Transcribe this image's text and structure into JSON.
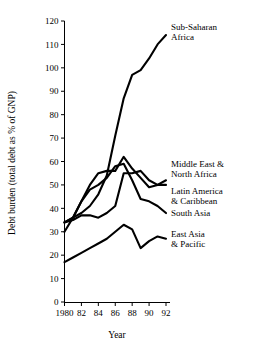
{
  "chart_data": {
    "type": "line",
    "title": "",
    "xlabel": "Year",
    "ylabel": "Debt burden (total debt as % of GNP)",
    "x": [
      1980,
      1981,
      1982,
      1983,
      1984,
      1985,
      1986,
      1987,
      1988,
      1989,
      1990,
      1991,
      1992
    ],
    "xtick_labels": [
      "1980",
      "82",
      "84",
      "86",
      "88",
      "90",
      "92"
    ],
    "xtick_values": [
      1980,
      1982,
      1984,
      1986,
      1988,
      1990,
      1992
    ],
    "ytick_labels": [
      "0",
      "10",
      "20",
      "30",
      "40",
      "50",
      "60",
      "70",
      "80",
      "90",
      "100",
      "110",
      "120"
    ],
    "ytick_values": [
      0,
      10,
      20,
      30,
      40,
      50,
      60,
      70,
      80,
      90,
      100,
      110,
      120
    ],
    "xlim": [
      1980,
      1992
    ],
    "ylim": [
      0,
      120
    ],
    "grid": false,
    "legend": "inline-right-labels",
    "series": [
      {
        "name": "Sub-Saharan Africa",
        "label_lines": [
          "Sub-Saharan",
          "Africa"
        ],
        "values": [
          34,
          38,
          42,
          48,
          53,
          60,
          73,
          88,
          97,
          99,
          104,
          110,
          114
        ]
      },
      {
        "name": "Middle East & North Africa",
        "label_lines": [
          "Middle East &",
          "North Africa"
        ],
        "values": [
          34,
          37,
          47,
          56,
          56,
          58,
          60,
          62,
          55,
          55,
          55,
          51,
          51
        ]
      },
      {
        "name": "Latin America & Caribbean",
        "label_lines": [
          "Latin America",
          "& Caribbean"
        ],
        "values": [
          30,
          36,
          43,
          47,
          49,
          53,
          57,
          59,
          51,
          45,
          43,
          41,
          40
        ]
      },
      {
        "name": "South Asia",
        "label_lines": [
          "South Asia"
        ],
        "values": [
          34,
          36,
          36,
          34,
          34,
          35,
          36,
          39,
          41,
          44,
          45,
          46,
          38
        ]
      },
      {
        "name": "East Asia & Pacific",
        "label_lines": [
          "East Asia",
          "& Pacific"
        ],
        "values": [
          17,
          19,
          22,
          24,
          25,
          27,
          31,
          33,
          32,
          23,
          27,
          30,
          38
        ]
      }
    ],
    "series_paths": {
      "sub_saharan_africa": "34,36,38,41,46,54,71,87,97,99,104,110,114",
      "middle_east_north_africa": "34,35,37,37,36,38,41,55,55,56,52,50,50",
      "latin_america_caribbean": "30,36,43,50,55,56,56,62,57,53,49,50,52",
      "south_asia": "34,36,43,48,50,53,58,59,52,44,43,41,38",
      "east_asia_pacific": "17,19,21,23,25,27,30,33,31,23,26,28,27"
    }
  },
  "labels": {
    "sub_saharan_l1": "Sub-Saharan",
    "sub_saharan_l2": "Africa",
    "mena_l1": "Middle East &",
    "mena_l2": "North Africa",
    "lac_l1": "Latin America",
    "lac_l2": "& Caribbean",
    "south_asia_l1": "South Asia",
    "east_asia_l1": "East Asia",
    "east_asia_l2": "& Pacific",
    "ylabel": "Debt burden (total debt as % of GNP)",
    "xlabel": "Year"
  },
  "yticks": [
    "120",
    "110",
    "100",
    "90",
    "80",
    "70",
    "60",
    "50",
    "40",
    "30",
    "20",
    "10",
    "0"
  ],
  "xticks": [
    "1980",
    "82",
    "84",
    "86",
    "88",
    "90",
    "92"
  ],
  "colors": {
    "line": "#000000",
    "axis": "#000000",
    "background": "#ffffff"
  }
}
